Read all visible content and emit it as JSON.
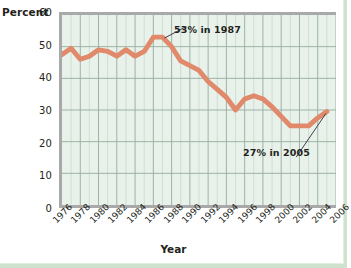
{
  "chart_data": {
    "type": "line",
    "title": "",
    "xlabel": "Year",
    "ylabel": "Percent",
    "xlim": [
      1976,
      2006
    ],
    "ylim": [
      0,
      60
    ],
    "grid": true,
    "legend": null,
    "line_color": "#e08a6b",
    "plot_background": "#e9f2ea",
    "gridline_color": "#9bb0a6",
    "y_ticks": [
      0,
      10,
      20,
      30,
      40,
      50,
      60
    ],
    "y_tick_labels": [
      "0",
      "10",
      "20",
      "30",
      "40",
      "50",
      "60"
    ],
    "x_ticks": [
      1976,
      1978,
      1980,
      1982,
      1984,
      1986,
      1988,
      1990,
      1992,
      1994,
      1996,
      1998,
      2000,
      2002,
      2004,
      2006
    ],
    "x_tick_labels": [
      "1976",
      "1978",
      "1980",
      "1982",
      "1984",
      "1986",
      "1988",
      "1990",
      "1992",
      "1994",
      "1996",
      "1998",
      "2000",
      "2002",
      "2004",
      "2006"
    ],
    "x": [
      1976,
      1977,
      1978,
      1979,
      1980,
      1981,
      1982,
      1983,
      1984,
      1985,
      1986,
      1987,
      1988,
      1989,
      1990,
      1991,
      1992,
      1993,
      1994,
      1995,
      1996,
      1997,
      1998,
      1999,
      2000,
      2001,
      2002,
      2003,
      2004,
      2005
    ],
    "y": [
      47.5,
      49.5,
      46,
      47,
      49,
      48.5,
      47,
      49,
      47,
      48.5,
      53,
      53,
      50,
      45.5,
      44,
      42.5,
      39,
      36.5,
      34,
      30,
      33.5,
      34.5,
      33.5,
      31,
      28,
      25,
      25,
      25,
      27.5,
      29.5
    ],
    "annotations": [
      {
        "name": "peak-annotation",
        "text": "53% in 1987",
        "year": 1987,
        "value": 53
      },
      {
        "name": "end-annotation",
        "text": "27% in 2005",
        "year": 2005,
        "value": 27
      }
    ]
  },
  "axis": {
    "y_title": "Percent",
    "x_title": "Year"
  }
}
